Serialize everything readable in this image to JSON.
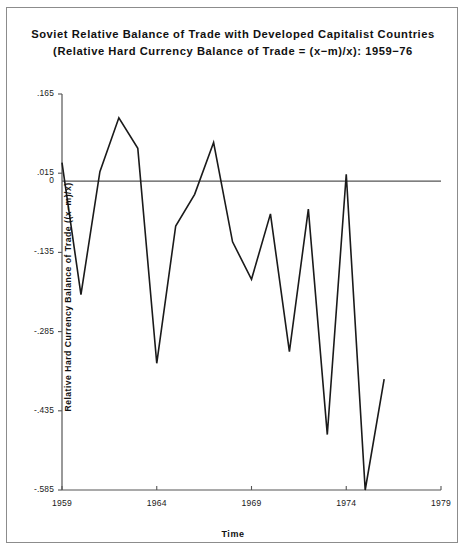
{
  "figure": {
    "title_line_1": "Soviet Relative Balance of Trade with Developed Capitalist Countries",
    "title_line_2": "(Relative Hard Currency Balance of Trade = (x−m)/x):  1959−76",
    "frame_color": "#8c8c8c",
    "line_color": "#1a1a1a",
    "axis_color": "#555555",
    "background": "#ffffff"
  },
  "chart_data": {
    "type": "line",
    "title": "Soviet Relative Balance of Trade with Developed Capitalist Countries (Relative Hard Currency Balance of Trade = (x−m)/x): 1959−76",
    "xlabel": "Time",
    "ylabel": "Relative Hard Currency Balance of Trade ((x−m)/x)",
    "xlim": [
      1959,
      1979
    ],
    "ylim": [
      -0.585,
      0.165
    ],
    "grid": false,
    "legend": false,
    "zero_line": 0,
    "xticks": [
      1959,
      1964,
      1969,
      1974,
      1979
    ],
    "xtick_labels": [
      "1959",
      "1964",
      "1969",
      "1974",
      "1979"
    ],
    "yticks": [
      0.165,
      0.015,
      0,
      -0.135,
      -0.285,
      -0.435,
      -0.585
    ],
    "ytick_labels": [
      ".165",
      ".015",
      "0",
      "-.135",
      "-.285",
      "-.435",
      "-.585"
    ],
    "x": [
      1959,
      1960,
      1961,
      1962,
      1963,
      1964,
      1965,
      1966,
      1967,
      1968,
      1969,
      1970,
      1971,
      1972,
      1973,
      1974,
      1975,
      1976
    ],
    "values": [
      0.035,
      -0.215,
      0.018,
      0.12,
      0.062,
      -0.345,
      -0.085,
      -0.025,
      0.073,
      -0.115,
      -0.186,
      -0.062,
      -0.323,
      -0.053,
      -0.48,
      0.013,
      -0.585,
      -0.375
    ],
    "series": [
      {
        "name": "Relative hard currency balance of trade",
        "values": [
          0.035,
          -0.215,
          0.018,
          0.12,
          0.062,
          -0.345,
          -0.085,
          -0.025,
          0.073,
          -0.115,
          -0.186,
          -0.062,
          -0.323,
          -0.053,
          -0.48,
          0.013,
          -0.585,
          -0.375
        ]
      }
    ]
  },
  "axis_labels": {
    "y": [
      {
        "text": ".165",
        "value": 0.165
      },
      {
        "text": ".015",
        "value": 0.015
      },
      {
        "text": "0",
        "value": 0
      },
      {
        "text": "-.135",
        "value": -0.135
      },
      {
        "text": "-.285",
        "value": -0.285
      },
      {
        "text": "-.435",
        "value": -0.435
      },
      {
        "text": "-.585",
        "value": -0.585
      }
    ],
    "x": [
      {
        "text": "1959",
        "value": 1959
      },
      {
        "text": "1964",
        "value": 1964
      },
      {
        "text": "1969",
        "value": 1969
      },
      {
        "text": "1974",
        "value": 1974
      },
      {
        "text": "1979",
        "value": 1979
      }
    ],
    "x_title": "Time",
    "y_title": "Relative Hard Currency Balance of Trade ((x−m)/x)"
  }
}
